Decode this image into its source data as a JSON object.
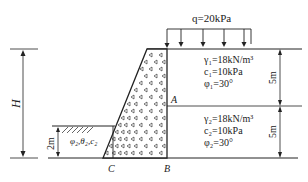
{
  "diagram": {
    "load": {
      "label": "q=20kPa"
    },
    "layer1": {
      "gamma": "γ₁=18kN/m³",
      "c": "c₁=10kPa",
      "phi": "φ₁=30°",
      "thickness": "5m"
    },
    "layer2": {
      "gamma": "γ₂=18kN/m³",
      "c": "c₂=10kPa",
      "phi": "φ₂=30°",
      "thickness": "5m"
    },
    "front_soil": {
      "label": "φ₂,θ₂,c₂",
      "depth": "2m"
    },
    "height_label": "H",
    "points": {
      "A": "A",
      "B": "B",
      "C": "C"
    },
    "colors": {
      "line": "#222222",
      "background": "#ffffff"
    }
  }
}
